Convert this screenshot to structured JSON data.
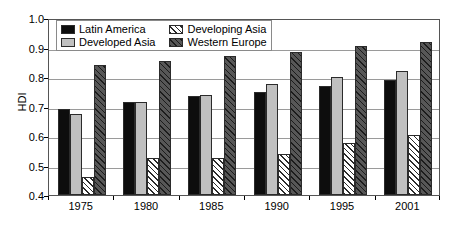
{
  "chart_data": {
    "type": "bar",
    "title": "",
    "subtitle": "",
    "xlabel": "",
    "ylabel": "HDI",
    "categories": [
      "1975",
      "1980",
      "1985",
      "1990",
      "1995",
      "2001"
    ],
    "series": [
      {
        "name": "Latin America",
        "pattern": "solid-black",
        "color": "#0d0d0d",
        "values": [
          0.69,
          0.715,
          0.735,
          0.75,
          0.77,
          0.79
        ]
      },
      {
        "name": "Developed Asia",
        "pattern": "solid-lightgray",
        "color": "#c0c0c0",
        "values": [
          0.675,
          0.715,
          0.74,
          0.775,
          0.8,
          0.82
        ]
      },
      {
        "name": "Developing Asia",
        "pattern": "diagonal-hatch",
        "color": "#ffffff",
        "values": [
          0.46,
          0.525,
          0.525,
          0.54,
          0.575,
          0.605
        ]
      },
      {
        "name": "Western Europe",
        "pattern": "crosshatch-dark",
        "color": "#4a4a4a",
        "values": [
          0.84,
          0.855,
          0.87,
          0.885,
          0.905,
          0.92
        ]
      }
    ],
    "ylim": [
      0.4,
      1.0
    ],
    "yticks": [
      0.4,
      0.5,
      0.6,
      0.7,
      0.8,
      0.9,
      1.0
    ],
    "ytick_labels": [
      "0.4",
      "0.5",
      "0.6",
      "0.7",
      "0.8",
      "0.9",
      "1.0"
    ],
    "grid": true,
    "grid_axis": "y",
    "legend_position": "top-left-inside",
    "legend_entries": [
      "Latin America",
      "Developing Asia",
      "Developed Asia",
      "Western Europe"
    ]
  },
  "axis": {
    "y_title": "HDI"
  },
  "legend": {
    "items": [
      {
        "label": "Latin America",
        "swatch": "swatch-latin-america"
      },
      {
        "label": "Developing Asia",
        "swatch": "swatch-developing-asia"
      },
      {
        "label": "Developed Asia",
        "swatch": "swatch-developed-asia"
      },
      {
        "label": "Western Europe",
        "swatch": "swatch-western-europe"
      }
    ]
  }
}
